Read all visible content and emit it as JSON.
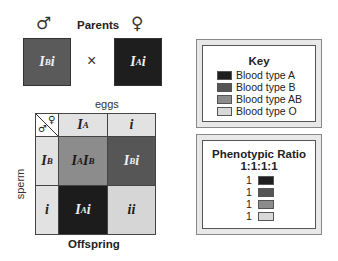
{
  "parents": {
    "title": "Parents",
    "male_symbol": "♂",
    "female_symbol": "♀",
    "cross_symbol": "×",
    "male": {
      "base": "I",
      "sup": "B",
      "suffix": "i",
      "color": "#5a5a5a"
    },
    "female": {
      "base": "I",
      "sup": "A",
      "suffix": "i",
      "color": "#1e1e1e"
    }
  },
  "punnett": {
    "top_label": "eggs",
    "side_label": "sperm",
    "bottom_label": "Offspring",
    "corner": {
      "male_symbol": "♂",
      "female_symbol": "♀"
    },
    "column_headers": [
      {
        "base": "I",
        "sup": "A",
        "suffix": ""
      },
      {
        "base": "",
        "sup": "",
        "suffix": "i"
      }
    ],
    "row_headers": [
      {
        "base": "I",
        "sup": "B",
        "suffix": ""
      },
      {
        "base": "",
        "sup": "",
        "suffix": "i"
      }
    ],
    "cells": [
      {
        "a": "I",
        "asup": "A",
        "b": "I",
        "bsup": "B",
        "suffix": "",
        "color": "#8c8c8c",
        "text_color": "#1a1a1a"
      },
      {
        "a": "I",
        "asup": "B",
        "b": "",
        "bsup": "",
        "suffix": "i",
        "color": "#565656",
        "text_color": "#eeeeee"
      },
      {
        "a": "I",
        "asup": "A",
        "b": "",
        "bsup": "",
        "suffix": "i",
        "color": "#1c1c1c",
        "text_color": "#eeeeee"
      },
      {
        "a": "",
        "asup": "",
        "b": "",
        "bsup": "",
        "suffix": "ii",
        "color": "#d6d6d6",
        "text_color": "#1a1a1a"
      }
    ],
    "header_bg": "#e2e2e2"
  },
  "key": {
    "title": "Key",
    "items": [
      {
        "label": "Blood type A",
        "color": "#1e1e1e"
      },
      {
        "label": "Blood type B",
        "color": "#555555"
      },
      {
        "label": "Blood type AB",
        "color": "#8c8c8c"
      },
      {
        "label": "Blood type O",
        "color": "#d8d8d8"
      }
    ]
  },
  "ratio": {
    "title": "Phenotypic Ratio",
    "value": "1:1:1:1",
    "items": [
      {
        "count": "1",
        "color": "#1e1e1e"
      },
      {
        "count": "1",
        "color": "#555555"
      },
      {
        "count": "1",
        "color": "#8c8c8c"
      },
      {
        "count": "1",
        "color": "#d8d8d8"
      }
    ]
  }
}
